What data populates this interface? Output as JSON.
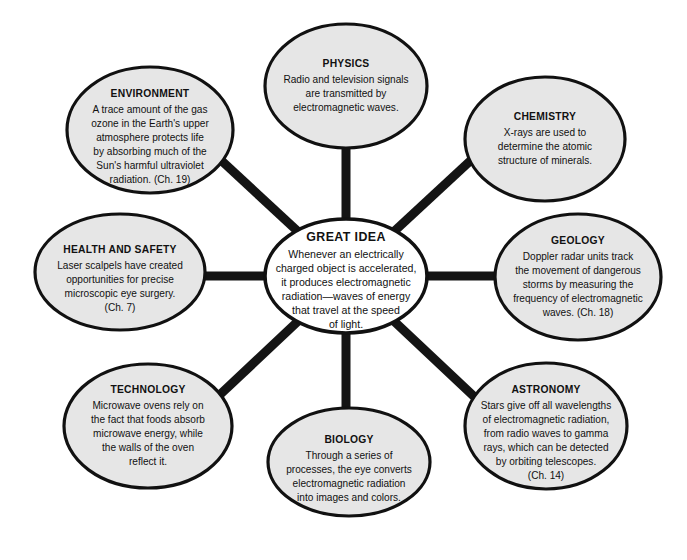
{
  "diagram": {
    "type": "concept-web",
    "title": "GREAT IDEA",
    "background_color": "#ffffff",
    "satellite_fill_color": "#e6e6e6",
    "center_fill_color": "#ffffff",
    "outline_color": "#111111",
    "spoke_color": "#141414",
    "center": {
      "title": "GREAT IDEA",
      "lines": [
        "Whenever an electrically",
        "charged object is accelerated,",
        "it produces electromagnetic",
        "radiation—waves of energy",
        "that travel at the speed",
        "of light."
      ]
    },
    "nodes": [
      {
        "id": "physics",
        "title": "PHYSICS",
        "lines": [
          "Radio and television signals",
          "are transmitted by",
          "electromagnetic waves."
        ]
      },
      {
        "id": "chemistry",
        "title": "CHEMISTRY",
        "lines": [
          "X-rays are used to",
          "determine the atomic",
          "structure of minerals."
        ]
      },
      {
        "id": "geology",
        "title": "GEOLOGY",
        "lines": [
          "Doppler radar units track",
          "the movement of dangerous",
          "storms by measuring the",
          "frequency of electromagnetic",
          "waves. (Ch. 18)"
        ]
      },
      {
        "id": "astronomy",
        "title": "ASTRONOMY",
        "lines": [
          "Stars give off all wavelengths",
          "of electromagnetic radiation,",
          "from radio waves to gamma",
          "rays, which can be detected",
          "by orbiting telescopes.",
          "(Ch. 14)"
        ]
      },
      {
        "id": "biology",
        "title": "BIOLOGY",
        "lines": [
          "Through a series of",
          "processes, the eye converts",
          "electromagnetic radiation",
          "into images and colors."
        ]
      },
      {
        "id": "technology",
        "title": "TECHNOLOGY",
        "lines": [
          "Microwave ovens rely on",
          "the fact that foods absorb",
          "microwave energy, while",
          "the walls of the oven",
          "reflect it."
        ]
      },
      {
        "id": "health-and-safety",
        "title": "HEALTH AND SAFETY",
        "lines": [
          "Laser scalpels have created",
          "opportunities for precise",
          "microscopic eye surgery.",
          "(Ch. 7)"
        ]
      },
      {
        "id": "environment",
        "title": "ENVIRONMENT",
        "lines": [
          "A trace amount of the gas",
          "ozone in the Earth's upper",
          "atmosphere protects life",
          "by absorbing much of the",
          "Sun's harmful ultraviolet",
          "radiation. (Ch. 19)"
        ]
      }
    ]
  }
}
